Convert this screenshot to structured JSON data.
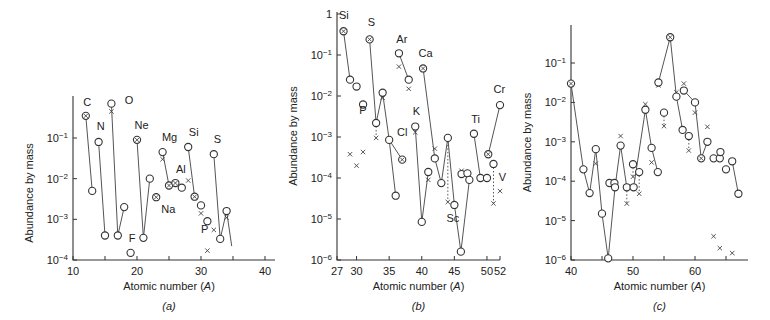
{
  "chart_data": [
    {
      "id": "a",
      "type": "scatter",
      "panel_label": "(a)",
      "xlabel": "Atomic number (A)",
      "ylabel": "Abundance by mass",
      "xlim": [
        10,
        40
      ],
      "ylim_log10": [
        -4,
        0
      ],
      "x_ticks": [
        10,
        20,
        30,
        40
      ],
      "x_minor_ticks": [
        15,
        25,
        35
      ],
      "y_ticks": [
        {
          "v": -4,
          "label": "10^-4"
        },
        {
          "v": -3,
          "label": "10^-3"
        },
        {
          "v": -2,
          "label": "10^-2"
        },
        {
          "v": -1,
          "label": "10^-1"
        }
      ],
      "axis_px": {
        "x0": 73,
        "x1": 265,
        "y0": 260,
        "y1": 138,
        "y0v": -4,
        "y1v": -1,
        "ytop": 96
      },
      "points": [
        {
          "A": 12,
          "y": 0.35,
          "m": "ox"
        },
        {
          "A": 13,
          "y": 0.005,
          "m": "o"
        },
        {
          "A": 14,
          "y": 0.08,
          "m": "o"
        },
        {
          "A": 15,
          "y": 0.0004,
          "m": "o"
        },
        {
          "A": 16,
          "y": 0.7,
          "m": "o"
        },
        {
          "A": 17,
          "y": 0.0004,
          "m": "o"
        },
        {
          "A": 18,
          "y": 0.002,
          "m": "o"
        },
        {
          "A": 19,
          "y": 0.00015,
          "m": "o"
        },
        {
          "A": 20,
          "y": 0.09,
          "m": "ox"
        },
        {
          "A": 21,
          "y": 0.00035,
          "m": "o"
        },
        {
          "A": 22,
          "y": 0.01,
          "m": "o"
        },
        {
          "A": 23,
          "y": 0.0035,
          "m": "ox"
        },
        {
          "A": 24,
          "y": 0.045,
          "m": "o"
        },
        {
          "A": 25,
          "y": 0.0068,
          "m": "ox"
        },
        {
          "A": 26,
          "y": 0.0078,
          "m": "ox"
        },
        {
          "A": 27,
          "y": 0.006,
          "m": "o"
        },
        {
          "A": 28,
          "y": 0.06,
          "m": "o"
        },
        {
          "A": 29,
          "y": 0.0036,
          "m": "ox"
        },
        {
          "A": 30,
          "y": 0.0022,
          "m": "o"
        },
        {
          "A": 31,
          "y": 0.0009,
          "m": "o"
        },
        {
          "A": 32,
          "y": 0.04,
          "m": "o"
        },
        {
          "A": 33,
          "y": 0.00033,
          "m": "o"
        },
        {
          "A": 34,
          "y": 0.0016,
          "m": "o"
        }
      ],
      "crosses": [
        {
          "A": 16,
          "y": 0.45
        },
        {
          "A": 24,
          "y": 0.03
        },
        {
          "A": 28,
          "y": 0.009
        },
        {
          "A": 30,
          "y": 0.0014
        },
        {
          "A": 31,
          "y": 0.00017
        },
        {
          "A": 32,
          "y": 0.00055
        },
        {
          "A": 34,
          "y": 0.0011
        }
      ],
      "lines": [
        [
          12,
          13
        ],
        [
          14,
          15
        ],
        [
          16,
          17,
          18
        ],
        [
          20,
          21,
          22
        ],
        [
          24,
          25
        ],
        [
          28,
          29
        ],
        [
          32,
          33,
          34
        ]
      ],
      "tail_line": {
        "from_A": 34,
        "to_A": 34.8,
        "to_y": 0.00022
      },
      "labels": [
        {
          "text": "C",
          "A": 11.6,
          "y": 0.62
        },
        {
          "text": "N",
          "A": 13.7,
          "y": 0.16
        },
        {
          "text": "O",
          "A": 18.1,
          "y": 0.68
        },
        {
          "text": "Ne",
          "A": 19.6,
          "y": 0.17
        },
        {
          "text": "F",
          "A": 18.7,
          "y": 0.00027
        },
        {
          "text": "Na",
          "A": 23.8,
          "y": 0.0014
        },
        {
          "text": "Mg",
          "A": 23.9,
          "y": 0.085
        },
        {
          "text": "Al",
          "A": 26.1,
          "y": 0.014
        },
        {
          "text": "Si",
          "A": 28.1,
          "y": 0.11
        },
        {
          "text": "P",
          "A": 30.0,
          "y": 0.00045
        },
        {
          "text": "S",
          "A": 32.0,
          "y": 0.075
        }
      ]
    },
    {
      "id": "b",
      "type": "scatter",
      "panel_label": "(b)",
      "xlabel": "Atomic number (A)",
      "ylabel": "Abundance by mass",
      "xlim": [
        27,
        52
      ],
      "ylim_log10": [
        -6,
        0
      ],
      "x_ticks": [
        27,
        30,
        35,
        40,
        45,
        50,
        52
      ],
      "x_minor_ticks": [],
      "y_ticks": [
        {
          "v": -6,
          "label": "10^-6"
        },
        {
          "v": -5,
          "label": "10^-5"
        },
        {
          "v": -4,
          "label": "10^-4"
        },
        {
          "v": -3,
          "label": "10^-3"
        },
        {
          "v": -2,
          "label": "10^-2"
        },
        {
          "v": -1,
          "label": "10^-1"
        },
        {
          "v": 0,
          "label": "1"
        }
      ],
      "axis_px": {
        "x0": 337,
        "x1": 500,
        "y0": 260,
        "y1": 14,
        "y0v": -6,
        "y1v": 0,
        "ytop": 12
      },
      "points": [
        {
          "A": 28,
          "y": 0.38,
          "m": "ox"
        },
        {
          "A": 29,
          "y": 0.025,
          "m": "o"
        },
        {
          "A": 30,
          "y": 0.017,
          "m": "o"
        },
        {
          "A": 31,
          "y": 0.0062,
          "m": "o"
        },
        {
          "A": 32,
          "y": 0.24,
          "m": "ox"
        },
        {
          "A": 33,
          "y": 0.0022,
          "m": "o"
        },
        {
          "A": 34,
          "y": 0.012,
          "m": "o"
        },
        {
          "A": 35,
          "y": 0.00085,
          "m": "o"
        },
        {
          "A": 36,
          "y": 3.7e-05,
          "m": "o"
        },
        {
          "A": 36.5,
          "y": 0.11,
          "m": "o"
        },
        {
          "A": 37,
          "y": 0.00028,
          "m": "ox"
        },
        {
          "A": 38,
          "y": 0.025,
          "m": "o"
        },
        {
          "A": 39,
          "y": 0.0018,
          "m": "o"
        },
        {
          "A": 40,
          "y": 8.5e-06,
          "m": "o"
        },
        {
          "A": 40.2,
          "y": 0.047,
          "m": "ox"
        },
        {
          "A": 41,
          "y": 0.00014,
          "m": "o"
        },
        {
          "A": 42,
          "y": 0.0003,
          "m": "o"
        },
        {
          "A": 43,
          "y": 7.5e-05,
          "m": "o"
        },
        {
          "A": 44,
          "y": 0.00095,
          "m": "o"
        },
        {
          "A": 45,
          "y": 2.2e-05,
          "m": "o"
        },
        {
          "A": 46,
          "y": 1.6e-06,
          "m": "o"
        },
        {
          "A": 46.1,
          "y": 0.000125,
          "m": "o"
        },
        {
          "A": 47,
          "y": 0.00013,
          "m": "o"
        },
        {
          "A": 47.3,
          "y": 9e-05,
          "m": "o"
        },
        {
          "A": 48,
          "y": 0.0012,
          "m": "o"
        },
        {
          "A": 49,
          "y": 0.0001,
          "m": "o"
        },
        {
          "A": 50,
          "y": 0.0001,
          "m": "o"
        },
        {
          "A": 50.2,
          "y": 0.00038,
          "m": "ox"
        },
        {
          "A": 51,
          "y": 0.00022,
          "m": "o"
        },
        {
          "A": 52,
          "y": 0.006,
          "m": "o"
        }
      ],
      "crosses": [
        {
          "A": 29,
          "y": 0.00038
        },
        {
          "A": 30,
          "y": 0.0002
        },
        {
          "A": 31,
          "y": 0.00043
        },
        {
          "A": 33,
          "y": 0.00095
        },
        {
          "A": 34,
          "y": 0.009
        },
        {
          "A": 36.5,
          "y": 0.052
        },
        {
          "A": 38,
          "y": 0.015
        },
        {
          "A": 39,
          "y": 0.0013
        },
        {
          "A": 41,
          "y": 9e-05
        },
        {
          "A": 42,
          "y": 0.00052
        },
        {
          "A": 44,
          "y": 2.6e-05
        },
        {
          "A": 46.1,
          "y": 0.00015
        },
        {
          "A": 51,
          "y": 2.4e-05
        },
        {
          "A": 52,
          "y": 4.8e-05
        }
      ],
      "lines": [
        [
          28,
          29
        ],
        [
          32,
          33,
          34,
          35,
          36
        ],
        [
          35,
          37
        ],
        [
          36.5,
          38
        ],
        [
          39,
          40,
          41
        ],
        [
          40.2,
          42,
          43,
          44,
          45,
          46,
          47.3
        ],
        [
          48,
          49
        ],
        [
          50.2,
          52
        ]
      ],
      "dotted_lines": [
        [
          33,
          0.0022,
          33,
          0.00095
        ],
        [
          44,
          0.00095,
          44,
          2.6e-05
        ],
        [
          51,
          0.00022,
          51,
          2.4e-05
        ]
      ],
      "labels": [
        {
          "text": "Si",
          "A": 27.3,
          "y": 0.75
        },
        {
          "text": "S",
          "A": 31.7,
          "y": 0.52
        },
        {
          "text": "P",
          "A": 30.4,
          "y": 0.0036
        },
        {
          "text": "Ar",
          "A": 36.1,
          "y": 0.2
        },
        {
          "text": "Ca",
          "A": 39.5,
          "y": 0.09
        },
        {
          "text": "Cl",
          "A": 36.2,
          "y": 0.00105
        },
        {
          "text": "K",
          "A": 38.6,
          "y": 0.0034
        },
        {
          "text": "Sc",
          "A": 43.8,
          "y": 8.5e-06
        },
        {
          "text": "Ti",
          "A": 47.6,
          "y": 0.0022
        },
        {
          "text": "Cr",
          "A": 51.0,
          "y": 0.012
        },
        {
          "text": "V",
          "A": 51.8,
          "y": 8.5e-05
        }
      ]
    },
    {
      "id": "c",
      "type": "scatter",
      "panel_label": "(c)",
      "xlabel": "Atomic number (A)",
      "ylabel": "Abundance by mass",
      "xlim": [
        40,
        68
      ],
      "ylim_log10": [
        -6,
        -0.3
      ],
      "x_ticks": [
        40,
        50,
        60
      ],
      "x_minor_ticks": [
        45,
        55,
        65
      ],
      "y_ticks": [
        {
          "v": -6,
          "label": "10^-6"
        },
        {
          "v": -5,
          "label": "10^-5"
        },
        {
          "v": -4,
          "label": "10^-4"
        },
        {
          "v": -3,
          "label": "10^-3"
        },
        {
          "v": -2,
          "label": "10^-2"
        },
        {
          "v": -1,
          "label": "10^-1"
        }
      ],
      "axis_px": {
        "x0": 571,
        "x1": 695,
        "x1v": 60,
        "y0": 260,
        "y1": 63,
        "y0v": -6,
        "y1v": -1,
        "ytop": 25,
        "xend": 748
      },
      "points": [
        {
          "A": 40,
          "y": 0.03,
          "m": "ox"
        },
        {
          "A": 42,
          "y": 0.0002,
          "m": "o"
        },
        {
          "A": 43,
          "y": 5e-05,
          "m": "o"
        },
        {
          "A": 44,
          "y": 0.00065,
          "m": "o"
        },
        {
          "A": 45,
          "y": 1.5e-05,
          "m": "o"
        },
        {
          "A": 46,
          "y": 1.1e-06,
          "m": "o"
        },
        {
          "A": 46.2,
          "y": 9e-05,
          "m": "o"
        },
        {
          "A": 47,
          "y": 9e-05,
          "m": "o"
        },
        {
          "A": 47.1,
          "y": 7e-05,
          "m": "o"
        },
        {
          "A": 48,
          "y": 0.0008,
          "m": "o"
        },
        {
          "A": 49,
          "y": 7e-05,
          "m": "o"
        },
        {
          "A": 50,
          "y": 0.00027,
          "m": "o"
        },
        {
          "A": 50.1,
          "y": 7e-05,
          "m": "o"
        },
        {
          "A": 51,
          "y": 0.00017,
          "m": "o"
        },
        {
          "A": 52,
          "y": 0.0065,
          "m": "o"
        },
        {
          "A": 53,
          "y": 0.0007,
          "m": "o"
        },
        {
          "A": 54,
          "y": 0.00017,
          "m": "o"
        },
        {
          "A": 54.1,
          "y": 0.032,
          "m": "o"
        },
        {
          "A": 55,
          "y": 0.0055,
          "m": "o"
        },
        {
          "A": 56,
          "y": 0.45,
          "m": "ox"
        },
        {
          "A": 57,
          "y": 0.014,
          "m": "o"
        },
        {
          "A": 58,
          "y": 0.002,
          "m": "o"
        },
        {
          "A": 58.2,
          "y": 0.02,
          "m": "o"
        },
        {
          "A": 59,
          "y": 0.0014,
          "m": "o"
        },
        {
          "A": 60,
          "y": 0.01,
          "m": "o"
        },
        {
          "A": 61,
          "y": 0.00038,
          "m": "ox"
        },
        {
          "A": 62,
          "y": 0.001,
          "m": "o"
        },
        {
          "A": 63,
          "y": 0.00038,
          "m": "o"
        },
        {
          "A": 64,
          "y": 0.00038,
          "m": "o"
        },
        {
          "A": 64.1,
          "y": 0.00055,
          "m": "o"
        },
        {
          "A": 65,
          "y": 0.0002,
          "m": "o"
        },
        {
          "A": 66,
          "y": 0.00032,
          "m": "o"
        },
        {
          "A": 67,
          "y": 4.8e-05,
          "m": "o"
        }
      ],
      "crosses": [
        {
          "A": 44,
          "y": 0.00028
        },
        {
          "A": 48,
          "y": 0.0014
        },
        {
          "A": 49,
          "y": 2.7e-05
        },
        {
          "A": 50,
          "y": 0.00013
        },
        {
          "A": 51,
          "y": 4.8e-05
        },
        {
          "A": 52,
          "y": 0.009
        },
        {
          "A": 53,
          "y": 0.0003
        },
        {
          "A": 54.1,
          "y": 0.027
        },
        {
          "A": 55,
          "y": 0.0025
        },
        {
          "A": 57,
          "y": 0.018
        },
        {
          "A": 58.2,
          "y": 0.03
        },
        {
          "A": 59,
          "y": 0.0006
        },
        {
          "A": 60,
          "y": 0.0055
        },
        {
          "A": 62,
          "y": 0.0024
        },
        {
          "A": 63,
          "y": 4e-06
        },
        {
          "A": 64,
          "y": 2e-06
        },
        {
          "A": 66,
          "y": 1.5e-06
        }
      ],
      "lines": [
        [
          40,
          42,
          43,
          44,
          45,
          46,
          47.1,
          48,
          49
        ],
        [
          50.1,
          52,
          53,
          54
        ],
        [
          54.1,
          56,
          57,
          58
        ],
        [
          58.2,
          60,
          61,
          62
        ],
        [
          66,
          67
        ]
      ],
      "dotted_lines": [
        [
          49,
          7e-05,
          49,
          2.7e-05
        ],
        [
          50,
          0.00027,
          50,
          0.00013
        ],
        [
          51,
          0.00017,
          51,
          4.8e-05
        ],
        [
          55,
          0.0055,
          55,
          0.0025
        ],
        [
          59,
          0.0014,
          59,
          0.0006
        ]
      ],
      "labels": []
    }
  ]
}
